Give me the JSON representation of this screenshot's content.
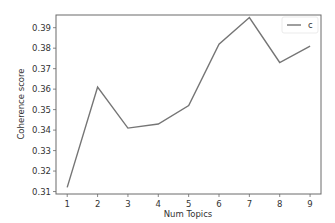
{
  "chart_data": {
    "type": "line",
    "title": "",
    "xlabel": "Num Topics",
    "ylabel": "Coherence score",
    "x": [
      1,
      2,
      3,
      4,
      5,
      6,
      7,
      8,
      9
    ],
    "series": [
      {
        "name": "c",
        "values": [
          0.312,
          0.361,
          0.341,
          0.343,
          0.352,
          0.382,
          0.395,
          0.373,
          0.381
        ],
        "color": "#757575"
      }
    ],
    "xticks": [
      "1",
      "2",
      "3",
      "4",
      "5",
      "6",
      "7",
      "8",
      "9"
    ],
    "yticks": [
      "0.31",
      "0.32",
      "0.33",
      "0.34",
      "0.35",
      "0.36",
      "0.37",
      "0.38",
      "0.39"
    ],
    "xlim": [
      0.63,
      9.36
    ],
    "ylim": [
      0.3088,
      0.3962
    ],
    "grid": false,
    "legend_position": "upper right"
  }
}
